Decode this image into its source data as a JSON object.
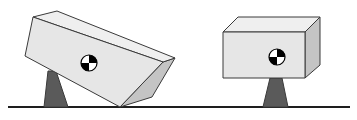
{
  "diagram": {
    "description": "Two rectangular blocks resting on triangular fulcrums above a ground line; left block tilted and falling, right block level and balanced. Each block shows a center-of-gravity target symbol.",
    "colors": {
      "background": "#ffffff",
      "outline": "#3a3a3a",
      "front_face": "#e6e6e6",
      "top_face": "#efefef",
      "side_face": "#c4c4c4",
      "fulcrum": "#5a5a5a",
      "ground": "#1e1e1e",
      "cg_dark": "#000000",
      "cg_light": "#ffffff"
    },
    "ground": {
      "x1": 8,
      "x2": 350,
      "y": 107,
      "thickness": 2
    },
    "blocks": [
      {
        "label": "tilted-block",
        "state": "unbalanced",
        "front_face": [
          [
            33,
            17
          ],
          [
            163,
            62
          ],
          [
            120,
            107
          ],
          [
            25,
            56
          ]
        ],
        "top_face": [
          [
            33,
            17
          ],
          [
            57,
            11
          ],
          [
            175,
            58
          ],
          [
            163,
            62
          ]
        ],
        "side_face": [
          [
            163,
            62
          ],
          [
            175,
            58
          ],
          [
            152,
            97
          ],
          [
            120,
            107
          ]
        ],
        "cg": {
          "cx": 89,
          "cy": 63,
          "r": 8
        },
        "fulcrum": [
          [
            48,
            71
          ],
          [
            56,
            71
          ],
          [
            68,
            107
          ],
          [
            44,
            107
          ]
        ]
      },
      {
        "label": "level-block",
        "state": "balanced",
        "front_face": [
          [
            223,
            32
          ],
          [
            305,
            32
          ],
          [
            305,
            78
          ],
          [
            223,
            78
          ]
        ],
        "top_face": [
          [
            223,
            32
          ],
          [
            238,
            17
          ],
          [
            320,
            17
          ],
          [
            305,
            32
          ]
        ],
        "side_face": [
          [
            305,
            32
          ],
          [
            320,
            17
          ],
          [
            320,
            65
          ],
          [
            305,
            78
          ]
        ],
        "cg": {
          "cx": 277,
          "cy": 57,
          "r": 8
        },
        "fulcrum": [
          [
            270,
            78
          ],
          [
            282,
            78
          ],
          [
            288,
            107
          ],
          [
            263,
            107
          ]
        ]
      }
    ]
  }
}
